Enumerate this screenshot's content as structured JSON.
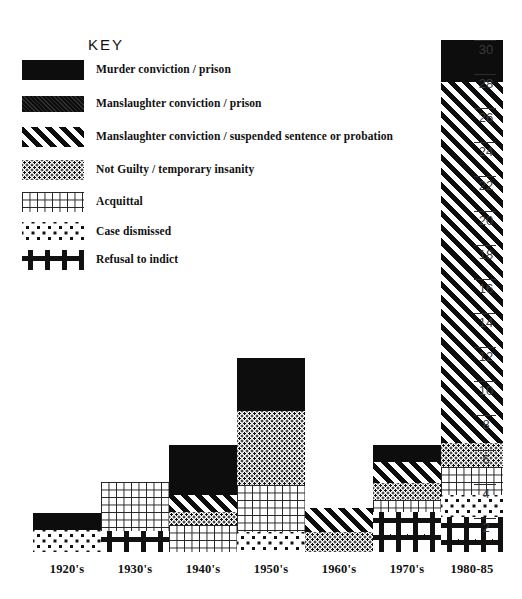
{
  "legend": {
    "title": "KEY",
    "items": [
      {
        "pattern": "solid",
        "label": "Murder conviction / prison"
      },
      {
        "pattern": "solid2",
        "label": "Manslaughter conviction / prison"
      },
      {
        "pattern": "diag",
        "label": "Manslaughter conviction / suspended sentence or probation"
      },
      {
        "pattern": "finedot",
        "label": "Not Guilty / temporary insanity"
      },
      {
        "pattern": "grid",
        "label": "Acquittal"
      },
      {
        "pattern": "coarsedot",
        "label": "Case dismissed"
      },
      {
        "pattern": "plus",
        "label": "Refusal to indict"
      }
    ]
  },
  "chart_data": {
    "type": "bar",
    "stacked": true,
    "title": "",
    "xlabel": "",
    "ylabel": "",
    "ylim": [
      0,
      30
    ],
    "grid": false,
    "legend_position": "top-left",
    "categories": [
      "1920's",
      "1930's",
      "1940's",
      "1950's",
      "1960's",
      "1970's",
      "1980-85"
    ],
    "y_ticks": [
      2,
      4,
      6,
      8,
      10,
      12,
      14,
      16,
      18,
      20,
      22,
      24,
      26,
      28,
      30
    ],
    "series": [
      {
        "name": "Murder conviction / prison",
        "pattern": "solid",
        "values": [
          1.0,
          0.0,
          3.0,
          3.2,
          0.0,
          1.0,
          2.5
        ]
      },
      {
        "name": "Manslaughter conviction / prison",
        "pattern": "solid2",
        "values": [
          0.0,
          0.0,
          0.0,
          0.0,
          0.0,
          0.0,
          0.0
        ]
      },
      {
        "name": "Manslaughter conviction / suspended sentence or probation",
        "pattern": "diag",
        "values": [
          0.0,
          0.0,
          1.1,
          0.0,
          1.5,
          1.3,
          21.0
        ]
      },
      {
        "name": "Not Guilty / temporary insanity",
        "pattern": "finedot",
        "values": [
          0.0,
          0.0,
          0.8,
          4.5,
          1.2,
          1.0,
          1.5
        ]
      },
      {
        "name": "Acquittal",
        "pattern": "grid",
        "values": [
          0.0,
          3.0,
          1.6,
          2.8,
          0.0,
          0.7,
          1.7
        ]
      },
      {
        "name": "Case dismissed",
        "pattern": "coarsedot",
        "values": [
          1.4,
          0.0,
          0.0,
          1.2,
          0.0,
          0.0,
          1.3
        ]
      },
      {
        "name": "Refusal to indict",
        "pattern": "plus",
        "values": [
          0.0,
          1.3,
          0.0,
          0.0,
          0.0,
          2.4,
          2.1
        ]
      }
    ],
    "totals": [
      2.4,
      4.3,
      6.5,
      11.7,
      2.7,
      6.4,
      30.1
    ],
    "bar_geometry": [
      {
        "category": "1920's",
        "x": 33,
        "width": 68,
        "segments": [
          {
            "pattern": "solid",
            "top": 513,
            "bottom": 530
          },
          {
            "pattern": "coarsedot",
            "top": 530,
            "bottom": 552
          }
        ]
      },
      {
        "category": "1930's",
        "x": 101,
        "width": 68,
        "segments": [
          {
            "pattern": "grid",
            "top": 482,
            "bottom": 531
          },
          {
            "pattern": "plus",
            "top": 531,
            "bottom": 552
          }
        ]
      },
      {
        "category": "1940's",
        "x": 169,
        "width": 68,
        "segments": [
          {
            "pattern": "solid",
            "top": 445,
            "bottom": 495
          },
          {
            "pattern": "diag",
            "top": 495,
            "bottom": 512
          },
          {
            "pattern": "finedot",
            "top": 512,
            "bottom": 525
          },
          {
            "pattern": "grid",
            "top": 525,
            "bottom": 552
          }
        ]
      },
      {
        "category": "1950's",
        "x": 237,
        "width": 68,
        "segments": [
          {
            "pattern": "solid",
            "top": 358,
            "bottom": 411
          },
          {
            "pattern": "finedot",
            "top": 411,
            "bottom": 485
          },
          {
            "pattern": "grid",
            "top": 485,
            "bottom": 532
          },
          {
            "pattern": "coarsedot",
            "top": 532,
            "bottom": 552
          }
        ]
      },
      {
        "category": "1960's",
        "x": 305,
        "width": 68,
        "segments": [
          {
            "pattern": "diag",
            "top": 508,
            "bottom": 532
          },
          {
            "pattern": "finedot",
            "top": 532,
            "bottom": 552
          }
        ]
      },
      {
        "category": "1970's",
        "x": 373,
        "width": 68,
        "segments": [
          {
            "pattern": "solid",
            "top": 445,
            "bottom": 462
          },
          {
            "pattern": "diag",
            "top": 462,
            "bottom": 483
          },
          {
            "pattern": "finedot",
            "top": 483,
            "bottom": 500
          },
          {
            "pattern": "grid",
            "top": 500,
            "bottom": 512
          },
          {
            "pattern": "plus",
            "top": 512,
            "bottom": 552
          }
        ]
      },
      {
        "category": "1980-85",
        "x": 441,
        "width": 62,
        "segments": [
          {
            "pattern": "solid",
            "top": 40,
            "bottom": 82
          },
          {
            "pattern": "diag",
            "top": 82,
            "bottom": 443
          },
          {
            "pattern": "finedot",
            "top": 443,
            "bottom": 467
          },
          {
            "pattern": "grid",
            "top": 467,
            "bottom": 495
          },
          {
            "pattern": "coarsedot",
            "top": 495,
            "bottom": 517
          },
          {
            "pattern": "plus",
            "top": 517,
            "bottom": 552
          }
        ]
      }
    ],
    "axis_geometry": {
      "baseline_y": 552,
      "unit_px": 17.07,
      "tick_x": 474
    }
  }
}
